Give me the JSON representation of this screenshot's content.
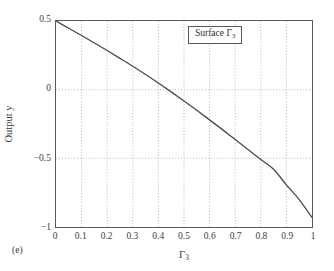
{
  "figure": {
    "panel_caption": "(e)",
    "background_color": "#ffffff",
    "frame_color": "#5a5a5a",
    "grid_color": "#9a9a9a",
    "curve_color": "#4a4a4a"
  },
  "legend": {
    "label_prefix": "Surface ",
    "label_symbol": "Γ",
    "label_subscript": "3",
    "position": "top-right-inside"
  },
  "axes": {
    "x_title_symbol": "Γ",
    "x_title_subscript": "3",
    "y_title": "Output y",
    "x_tick_labels": [
      "0",
      "0.1",
      "0.2",
      "0.3",
      "0.4",
      "0.5",
      "0.6",
      "0.7",
      "0.8",
      "0.9",
      "1"
    ],
    "y_tick_labels": [
      "0.5",
      "0",
      "−0.5",
      "−1"
    ]
  },
  "chart_data": {
    "type": "line",
    "title": "",
    "subtitle": "",
    "xlabel": "Γ3",
    "ylabel": "Output y",
    "xlim": [
      0,
      1
    ],
    "ylim": [
      -1,
      0.5
    ],
    "xticks": [
      0,
      0.1,
      0.2,
      0.3,
      0.4,
      0.5,
      0.6,
      0.7,
      0.8,
      0.9,
      1
    ],
    "yticks": [
      0.5,
      0,
      -0.5,
      -1
    ],
    "grid": true,
    "grid_style": "dotted",
    "legend_position": "upper right",
    "annotations": [
      {
        "text": "(e)",
        "position": "below-left-outside"
      }
    ],
    "series": [
      {
        "name": "Surface Γ3",
        "color": "#4a4a4a",
        "x": [
          0.0,
          0.05,
          0.1,
          0.15,
          0.2,
          0.25,
          0.3,
          0.35,
          0.4,
          0.45,
          0.5,
          0.55,
          0.6,
          0.65,
          0.7,
          0.75,
          0.8,
          0.85,
          0.9,
          0.95,
          1.0
        ],
        "values": [
          0.5,
          0.447,
          0.394,
          0.34,
          0.285,
          0.228,
          0.17,
          0.11,
          0.048,
          -0.016,
          -0.082,
          -0.15,
          -0.22,
          -0.291,
          -0.363,
          -0.436,
          -0.508,
          -0.58,
          -0.694,
          -0.8,
          -0.93
        ]
      }
    ],
    "key_points": [
      {
        "label": "start",
        "x": 0.0,
        "y": 0.5
      },
      {
        "label": "zero-crossing",
        "x": 0.44,
        "y": 0.0
      },
      {
        "label": "half-crossing",
        "x": 0.79,
        "y": -0.5
      },
      {
        "label": "end",
        "x": 1.0,
        "y": -0.93
      }
    ]
  }
}
